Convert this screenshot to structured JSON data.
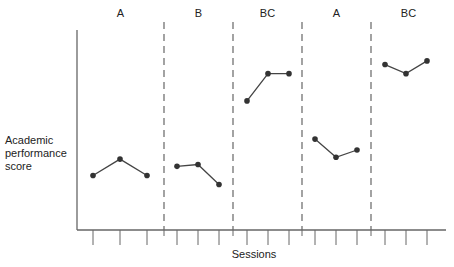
{
  "chart_data": {
    "type": "line",
    "title": "",
    "xlabel": "Sessions",
    "ylabel": "Academic performance score",
    "ylabel_lines": [
      "Academic",
      "performance",
      "score"
    ],
    "grid": false,
    "phases": [
      {
        "label": "A",
        "values": [
          3.0,
          3.9,
          3.0
        ]
      },
      {
        "label": "B",
        "values": [
          3.5,
          3.6,
          2.5
        ]
      },
      {
        "label": "BC",
        "values": [
          7.1,
          8.6,
          8.6
        ]
      },
      {
        "label": "A",
        "values": [
          5.0,
          4.0,
          4.4
        ]
      },
      {
        "label": "BC",
        "values": [
          9.1,
          8.6,
          9.3
        ]
      }
    ],
    "categories": [
      "1",
      "2",
      "3",
      "4",
      "5",
      "6",
      "7",
      "8",
      "9",
      "10",
      "11",
      "12",
      "13",
      "14",
      "15"
    ],
    "series": [
      {
        "name": "Academic performance score",
        "values": [
          3.0,
          3.9,
          3.0,
          3.5,
          3.6,
          2.5,
          7.1,
          8.6,
          8.6,
          5.0,
          4.0,
          4.4,
          9.1,
          8.6,
          9.3
        ]
      }
    ],
    "ylim": [
      0,
      11
    ]
  }
}
